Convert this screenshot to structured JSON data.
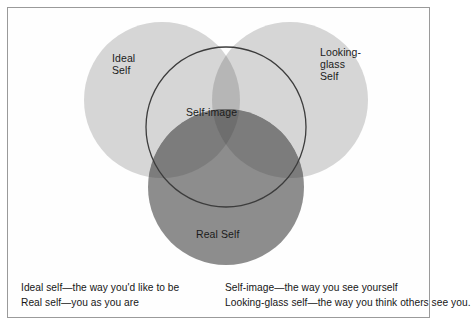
{
  "figure": {
    "kind": "venn-diagram",
    "background_color": "#ffffff",
    "frame_color": "#9a9a9a"
  },
  "circles": {
    "ideal_self": {
      "label": "Ideal\nSelf",
      "label_text_flat": "Ideal Self",
      "fill": "#d6d6d6",
      "center_x": 162,
      "center_y": 100,
      "radius": 78,
      "stroke": "none"
    },
    "looking_glass_self": {
      "label": "Looking-\nglass\nSelf",
      "label_text_flat": "Looking-glass Self",
      "fill": "#d6d6d6",
      "center_x": 290,
      "center_y": 100,
      "radius": 78,
      "stroke": "none"
    },
    "real_self": {
      "label": "Real Self",
      "label_text_flat": "Real Self",
      "fill": "#8d8d8d",
      "center_x": 226,
      "center_y": 187,
      "radius": 78,
      "stroke": "none"
    },
    "self_image": {
      "label": "Self-image",
      "label_text_flat": "Self-image",
      "fill": "none",
      "center_x": 226,
      "center_y": 127,
      "radius": 80,
      "stroke": "#3c3c3c",
      "stroke_width": 1.3
    }
  },
  "overlaps": {
    "ideal_and_looking_glass_fill": "#b6b6b6",
    "real_over_light_fill": "#7c7c7c",
    "real_over_both_light_fill": "#6e6e6e"
  },
  "caption": {
    "left_column": [
      "Ideal self—the way you'd like to be",
      "Real self—you as you are"
    ],
    "right_column": [
      "Self-image—the way you see yourself",
      "Looking-glass self—the way you think others see you."
    ]
  }
}
